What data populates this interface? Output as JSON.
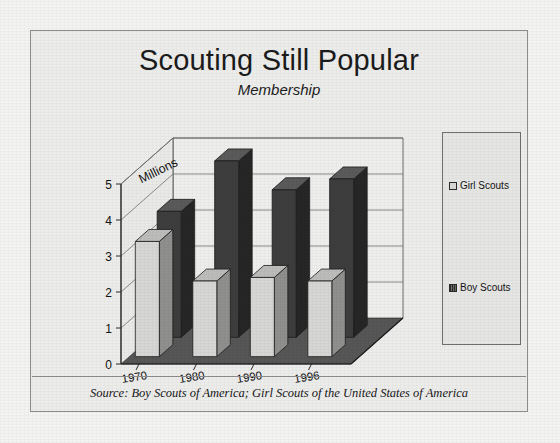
{
  "figure": {
    "title": "Scouting Still Popular",
    "subtitle": "Membership",
    "source": "Source:  Boy Scouts of America; Girl Scouts of the United States of America"
  },
  "legend": {
    "items": [
      {
        "label": "Girl Scouts",
        "swatch": "light",
        "color": "#d8d8d6"
      },
      {
        "label": "Boy Scouts",
        "swatch": "dark",
        "color": "#3a3a3a"
      }
    ]
  },
  "axis": {
    "unit_label": "Millions",
    "y_ticks": [
      "0",
      "1",
      "2",
      "3",
      "4",
      "5"
    ],
    "x_ticks": [
      "1970",
      "1980",
      "1990",
      "1996"
    ]
  },
  "chart_data": {
    "type": "bar",
    "title": "Scouting Still Popular",
    "subtitle": "Membership",
    "xlabel": "",
    "ylabel": "Millions",
    "ylim": [
      0,
      5
    ],
    "yticks": [
      0,
      1,
      2,
      3,
      4,
      5
    ],
    "grid": true,
    "legend_position": "right",
    "projection": "3d",
    "categories": [
      "1970",
      "1980",
      "1990",
      "1996"
    ],
    "series": [
      {
        "name": "Girl Scouts",
        "color": "#d8d8d6",
        "values": [
          3.2,
          2.1,
          2.2,
          2.1
        ]
      },
      {
        "name": "Boy Scouts",
        "color": "#3a3a3a",
        "values": [
          3.5,
          4.9,
          4.1,
          4.4
        ]
      }
    ],
    "annotations": [
      "Millions"
    ],
    "source": "Source:  Boy Scouts of America; Girl Scouts of the United States of America"
  }
}
